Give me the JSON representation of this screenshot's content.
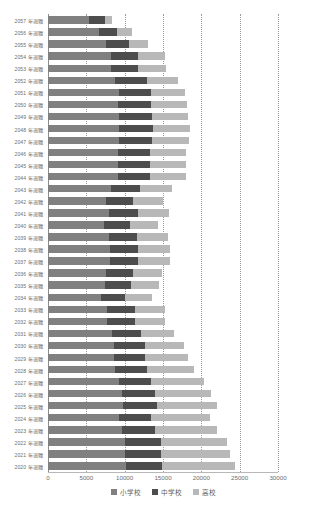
{
  "chart_data": {
    "type": "bar",
    "orientation": "horizontal",
    "stacked": true,
    "title": "",
    "xlabel": "",
    "ylabel": "",
    "xlim": [
      0,
      30000
    ],
    "xticks": [
      "0",
      "5000",
      "10000",
      "15000",
      "20000",
      "25000",
      "30000"
    ],
    "xtick_values": [
      0,
      5000,
      10000,
      15000,
      20000,
      25000,
      30000
    ],
    "grid": true,
    "grid_axis": "x",
    "grid_style": "dotted",
    "legend_position": "bottom",
    "legend": [
      "小学校",
      "中学校",
      "高校"
    ],
    "colors": [
      "#808080",
      "#4d4d4d",
      "#b8b8b8"
    ],
    "categories": [
      "2057 年退職",
      "2056 年退職",
      "2055 年退職",
      "2054 年退職",
      "2053 年退職",
      "2052 年退職",
      "2051 年退職",
      "2050 年退職",
      "2049 年退職",
      "2048 年退職",
      "2047 年退職",
      "2046 年退職",
      "2045 年退職",
      "2044 年退職",
      "2043 年退職",
      "2042 年退職",
      "2041 年退職",
      "2040 年退職",
      "2039 年退職",
      "2038 年退職",
      "2037 年退職",
      "2036 年退職",
      "2035 年退職",
      "2034 年退職",
      "2033 年退職",
      "2032 年退職",
      "2031 年退職",
      "2030 年退職",
      "2029 年退職",
      "2028 年退職",
      "2027 年退職",
      "2026 年退職",
      "2025 年退職",
      "2024 年退職",
      "2023 年退職",
      "2022 年退職",
      "2021 年退職",
      "2020 年退職"
    ],
    "series": [
      {
        "name": "小学校",
        "color": "#808080",
        "values": [
          5400,
          6600,
          7500,
          8200,
          8200,
          8800,
          9200,
          9100,
          9200,
          9300,
          9300,
          9100,
          9100,
          9100,
          8200,
          7600,
          8000,
          7300,
          8000,
          8100,
          8100,
          7600,
          7400,
          6900,
          7700,
          7700,
          8300,
          8600,
          8600,
          8800,
          9300,
          9700,
          9800,
          9200,
          9600,
          10100,
          10100,
          10200
        ]
      },
      {
        "name": "中学校",
        "color": "#4d4d4d",
        "values": [
          2000,
          2400,
          3000,
          3600,
          3500,
          4100,
          4300,
          4400,
          4400,
          4400,
          4300,
          4200,
          4200,
          4200,
          3800,
          3500,
          3700,
          3400,
          3600,
          3700,
          3700,
          3500,
          3400,
          3200,
          3600,
          3600,
          3800,
          4000,
          4000,
          4100,
          4200,
          4300,
          4400,
          4300,
          4400,
          4600,
          4600,
          4700
        ]
      },
      {
        "name": "高校",
        "color": "#b8b8b8",
        "values": [
          1000,
          2000,
          2600,
          3400,
          3700,
          4100,
          4400,
          4600,
          4700,
          4800,
          4800,
          4700,
          4700,
          4700,
          4200,
          3900,
          4100,
          3700,
          4000,
          4100,
          4100,
          3800,
          3700,
          3500,
          4000,
          4000,
          4400,
          5100,
          5600,
          6200,
          6800,
          7300,
          7800,
          7600,
          8100,
          8600,
          9100,
          9500
        ]
      }
    ]
  }
}
